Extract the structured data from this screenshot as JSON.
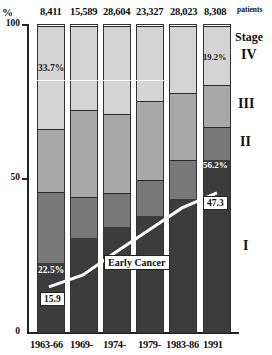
{
  "chart_data": {
    "type": "bar",
    "subtype": "stacked-100-percent",
    "title": "",
    "ylabel": "%",
    "xlabel": "",
    "ylim": [
      0,
      100
    ],
    "yticks": [
      "0",
      "50",
      "100"
    ],
    "categories": [
      "1963-66",
      "1969-",
      "1974-",
      "1979-",
      "1983-86",
      "1991"
    ],
    "patients_label": "patients",
    "patient_counts": [
      "8,411",
      "15,589",
      "28,604",
      "23,327",
      "28,023",
      "8,308"
    ],
    "legend_title": "Stage",
    "series": [
      {
        "name": "I",
        "color": "#3c3c3c",
        "values": [
          22.5,
          30.7,
          34.3,
          37.9,
          43.4,
          56.2
        ]
      },
      {
        "name": "II",
        "color": "#787878",
        "values": [
          23.1,
          13.3,
          11.0,
          11.9,
          12.9,
          10.8
        ]
      },
      {
        "name": "III",
        "color": "#a8a8a8",
        "values": [
          20.7,
          28.5,
          25.9,
          25.6,
          21.7,
          13.8
        ]
      },
      {
        "name": "IV",
        "color": "#d4d4d4",
        "values": [
          33.7,
          27.5,
          28.8,
          24.6,
          22.0,
          19.2
        ]
      }
    ],
    "line_series": {
      "name": "Early Cancer",
      "color": "#ffffff",
      "values": [
        15.9,
        18.8,
        26.2,
        33.3,
        40.5,
        47.3
      ]
    },
    "annotations": [
      {
        "text": "33.7%",
        "category": "1963-66",
        "series": "IV"
      },
      {
        "text": "22.5%",
        "category": "1963-66",
        "series": "I"
      },
      {
        "text": "15.9",
        "category": "1963-66",
        "series": "Early Cancer"
      },
      {
        "text": "19.2%",
        "category": "1991",
        "series": "IV"
      },
      {
        "text": "56.2%",
        "category": "1991",
        "series": "I"
      },
      {
        "text": "47.3",
        "category": "1991",
        "series": "Early Cancer"
      },
      {
        "text": "Early Cancer",
        "label_for": "line"
      }
    ],
    "grid": false,
    "legend_position": "right"
  },
  "labels": {
    "y_unit": "%",
    "y100": "100",
    "y50": "50",
    "y0": "0",
    "patients": "patients",
    "stage_title": "Stage",
    "stage_iv": "IV",
    "stage_iii": "III",
    "stage_ii": "II",
    "stage_i": "I",
    "ann_iv_first": "33.7%",
    "ann_i_first": "22.5%",
    "ann_line_first": "15.9",
    "ann_iv_last": "19.2%",
    "ann_i_last": "56.2%",
    "ann_line_last": "47.3",
    "line_label": "Early Cancer"
  }
}
